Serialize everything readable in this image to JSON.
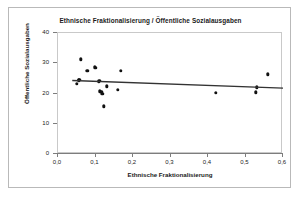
{
  "chart_data": {
    "type": "scatter",
    "title": "Ethnische Fraktionalisierung / Öffentliche Sozialausgaben",
    "xlabel": "Ethnische Fraktionalisierung",
    "ylabel": "Öffentliche Sozialausgaben",
    "xlim": [
      0.0,
      0.6
    ],
    "ylim": [
      0,
      40
    ],
    "xticks": [
      0.0,
      0.1,
      0.2,
      0.3,
      0.4,
      0.5,
      0.6
    ],
    "xticklabels": [
      "0,0",
      "0,1",
      "0,2",
      "0,3",
      "0,4",
      "0,5",
      "0,6"
    ],
    "yticks": [
      0,
      10,
      20,
      30,
      40
    ],
    "yticklabels": [
      "0",
      "10",
      "20",
      "30",
      "40"
    ],
    "grid": false,
    "legend": false,
    "marker_color": "#111111",
    "trendline_color": "#333333",
    "points": [
      {
        "x": 0.05,
        "y": 23.3
      },
      {
        "x": 0.055,
        "y": 24.3
      },
      {
        "x": 0.057,
        "y": 24.5
      },
      {
        "x": 0.06,
        "y": 31.3
      },
      {
        "x": 0.078,
        "y": 27.6
      },
      {
        "x": 0.1,
        "y": 28.4
      },
      {
        "x": 0.098,
        "y": 28.6
      },
      {
        "x": 0.108,
        "y": 23.9
      },
      {
        "x": 0.11,
        "y": 24.1
      },
      {
        "x": 0.112,
        "y": 20.7
      },
      {
        "x": 0.115,
        "y": 20.5
      },
      {
        "x": 0.118,
        "y": 20.0
      },
      {
        "x": 0.122,
        "y": 15.8
      },
      {
        "x": 0.13,
        "y": 22.4
      },
      {
        "x": 0.16,
        "y": 21.2
      },
      {
        "x": 0.168,
        "y": 27.5
      },
      {
        "x": 0.42,
        "y": 20.3
      },
      {
        "x": 0.528,
        "y": 20.4
      },
      {
        "x": 0.53,
        "y": 22.0
      },
      {
        "x": 0.56,
        "y": 26.3
      }
    ],
    "trendline": {
      "x0": 0.038,
      "y0": 24.3,
      "x1": 0.6,
      "y1": 21.8
    }
  }
}
